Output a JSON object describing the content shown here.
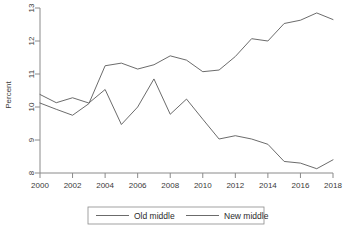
{
  "chart_data": {
    "type": "line",
    "title": "",
    "xlabel": "",
    "ylabel": "Percent",
    "xlim": [
      2000,
      2018
    ],
    "ylim": [
      8,
      13
    ],
    "grid": false,
    "legend_position": "bottom",
    "x": [
      2000,
      2001,
      2002,
      2003,
      2004,
      2005,
      2006,
      2007,
      2008,
      2009,
      2010,
      2011,
      2012,
      2013,
      2014,
      2015,
      2016,
      2017,
      2018
    ],
    "xticks": [
      "2000",
      "2002",
      "2004",
      "2006",
      "2008",
      "2010",
      "2012",
      "2014",
      "2016",
      "2018"
    ],
    "yticks": [
      "8",
      "9",
      "10",
      "11",
      "12",
      "13"
    ],
    "series": [
      {
        "name": "Old middle",
        "values": [
          10.38,
          10.13,
          10.28,
          10.12,
          10.53,
          9.47,
          10.0,
          10.85,
          9.78,
          10.24,
          9.63,
          9.03,
          9.13,
          9.03,
          8.87,
          8.35,
          8.3,
          8.13,
          8.4
        ]
      },
      {
        "name": "New middle",
        "values": [
          10.12,
          9.93,
          9.75,
          10.1,
          11.25,
          11.33,
          11.15,
          11.28,
          11.55,
          11.42,
          11.07,
          11.12,
          11.53,
          12.07,
          12.0,
          12.53,
          12.63,
          12.85,
          12.65
        ]
      }
    ]
  },
  "legend": {
    "entries": [
      {
        "label": "Old middle"
      },
      {
        "label": "New middle"
      }
    ]
  },
  "axes": {
    "y_title": "Percent"
  }
}
